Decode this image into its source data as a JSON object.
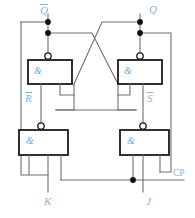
{
  "diagram": {
    "colors": {
      "wire": "#6f6f6f",
      "gate_border": "#1a1a1a",
      "label": "#7fb7e0",
      "gate_symbol": "#6aaddf",
      "background": "#ffffff",
      "junction_dot": "#111111"
    },
    "gate_symbol": "&",
    "gates": [
      {
        "id": "upper-left-nand",
        "symbol": "&",
        "x": 28,
        "y": 60,
        "w": 44,
        "h": 24
      },
      {
        "id": "upper-right-nand",
        "symbol": "&",
        "x": 118,
        "y": 60,
        "w": 44,
        "h": 24
      },
      {
        "id": "lower-left-nand",
        "symbol": "&",
        "x": 19,
        "y": 130,
        "w": 49,
        "h": 25
      },
      {
        "id": "lower-right-nand",
        "symbol": "&",
        "x": 120,
        "y": 130,
        "w": 49,
        "h": 25
      }
    ],
    "labels": [
      {
        "id": "q-not-label",
        "text": "Q",
        "overline": true,
        "x": 40,
        "y": 6,
        "align": "left"
      },
      {
        "id": "q-label",
        "text": "Q",
        "overline": false,
        "x": 148,
        "y": 6,
        "align": "left"
      },
      {
        "id": "r-not-label",
        "text": "R",
        "overline": true,
        "x": 25,
        "y": 95,
        "align": "left"
      },
      {
        "id": "s-not-label",
        "text": "S",
        "overline": true,
        "x": 146,
        "y": 95,
        "align": "left"
      },
      {
        "id": "k-label",
        "text": "K",
        "overline": false,
        "x": 48,
        "y": 198,
        "align": "left"
      },
      {
        "id": "j-label",
        "text": "J",
        "overline": false,
        "x": 146,
        "y": 198,
        "align": "left"
      },
      {
        "id": "cp-label",
        "text": "CP",
        "overline": false,
        "x": 172,
        "y": 170,
        "align": "left"
      }
    ],
    "junction_dots": [
      {
        "id": "dot-qnot-upper",
        "x": 48,
        "y": 22
      },
      {
        "id": "dot-qnot-lower",
        "x": 48,
        "y": 33
      },
      {
        "id": "dot-q-upper",
        "x": 140,
        "y": 22
      },
      {
        "id": "dot-q-lower",
        "x": 140,
        "y": 33
      },
      {
        "id": "dot-cp-line",
        "x": 133,
        "y": 180
      }
    ],
    "inversion_bubbles": [
      {
        "id": "bubble-upper-left",
        "x": 48,
        "y": 56
      },
      {
        "id": "bubble-upper-right",
        "x": 140,
        "y": 56
      },
      {
        "id": "bubble-lower-left",
        "x": 41,
        "y": 126
      },
      {
        "id": "bubble-lower-right",
        "x": 143,
        "y": 126
      }
    ]
  }
}
